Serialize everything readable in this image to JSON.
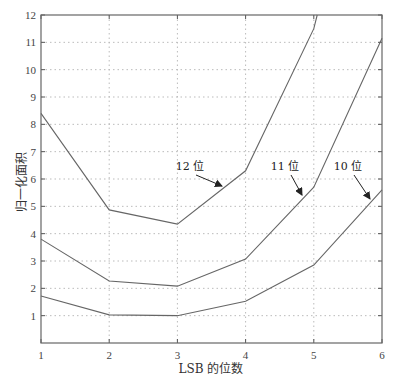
{
  "chart_data": {
    "type": "line",
    "title": "",
    "xlabel": "LSB 的位数",
    "ylabel": "归一化面积",
    "x": [
      1,
      2,
      3,
      4,
      5,
      6
    ],
    "xlim": [
      1,
      6
    ],
    "ylim": [
      0,
      12
    ],
    "xticks": [
      "1",
      "2",
      "3",
      "4",
      "5",
      "6"
    ],
    "yticks": [
      "1",
      "2",
      "3",
      "4",
      "5",
      "6",
      "7",
      "8",
      "9",
      "10",
      "11",
      "12"
    ],
    "grid": true,
    "series": [
      {
        "name": "12 位",
        "x": [
          1,
          2,
          3,
          4,
          5,
          5.05
        ],
        "values": [
          8.4,
          4.87,
          4.35,
          6.3,
          11.5,
          12
        ]
      },
      {
        "name": "11 位",
        "x": [
          1,
          2,
          3,
          4,
          5,
          6
        ],
        "values": [
          3.8,
          2.27,
          2.08,
          3.07,
          5.7,
          11.15
        ]
      },
      {
        "name": "10 位",
        "x": [
          1,
          2,
          3,
          4,
          5,
          6
        ],
        "values": [
          1.72,
          1.03,
          1.0,
          1.53,
          2.85,
          5.6
        ]
      }
    ],
    "annotations": [
      {
        "text": "12 位",
        "label_xy": [
          190,
          170
        ],
        "arrow_to": [
          222,
          186
        ]
      },
      {
        "text": "11 位",
        "label_xy": [
          285,
          170
        ],
        "arrow_to": [
          302,
          195
        ]
      },
      {
        "text": "10 位",
        "label_xy": [
          348,
          170
        ],
        "arrow_to": [
          370,
          199
        ]
      }
    ]
  }
}
